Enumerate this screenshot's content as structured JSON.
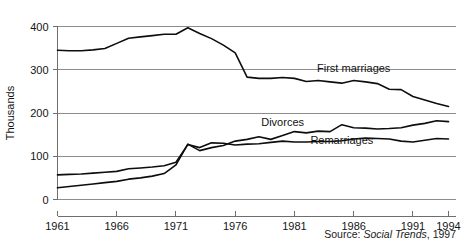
{
  "source_note": {
    "prefix": "Source:",
    "italic": "Social Trends",
    "suffix": ", 1997"
  },
  "chart_data": {
    "type": "line",
    "title": "",
    "xlabel": "",
    "ylabel": "Thousands",
    "xlim": [
      1961,
      1994
    ],
    "ylim": [
      0,
      400
    ],
    "yticks": [
      0,
      100,
      200,
      300,
      400
    ],
    "ytick_labels": [
      "0",
      "100",
      "200",
      "300",
      "400"
    ],
    "xticks": [
      1961,
      1966,
      1971,
      1976,
      1981,
      1986,
      1991,
      1994
    ],
    "xtick_labels": [
      "1961",
      "1966",
      "1971",
      "1976",
      "1981",
      "1986",
      "1991",
      "1994"
    ],
    "grid": "horizontal",
    "legend_position": "inline-labels",
    "x": [
      1961,
      1962,
      1963,
      1964,
      1965,
      1966,
      1967,
      1968,
      1969,
      1970,
      1971,
      1972,
      1973,
      1974,
      1975,
      1976,
      1977,
      1978,
      1979,
      1980,
      1981,
      1982,
      1983,
      1984,
      1985,
      1986,
      1987,
      1988,
      1989,
      1990,
      1991,
      1992,
      1993,
      1994
    ],
    "series": [
      {
        "name": "First marriages",
        "label": "First marriages",
        "label_x": 1986,
        "label_y": 295,
        "color": "#0d0d0d",
        "values": [
          345,
          344,
          344,
          346,
          349,
          361,
          373,
          376,
          379,
          382,
          382,
          397,
          384,
          372,
          357,
          339,
          283,
          280,
          280,
          282,
          280,
          273,
          275,
          272,
          269,
          275,
          272,
          268,
          255,
          254,
          238,
          230,
          222,
          215
        ]
      },
      {
        "name": "Divorces",
        "label": "Divorces",
        "label_x": 1980,
        "label_y": 170,
        "color": "#0d0d0d",
        "values": [
          27,
          30,
          33,
          36,
          39,
          42,
          47,
          50,
          54,
          60,
          80,
          128,
          113,
          120,
          125,
          135,
          139,
          145,
          139,
          148,
          157,
          154,
          158,
          157,
          173,
          166,
          165,
          163,
          164,
          166,
          172,
          176,
          182,
          180
        ]
      },
      {
        "name": "Remarriages",
        "label": "Remarriages",
        "label_x": 1985,
        "label_y": 128,
        "color": "#0d0d0d",
        "values": [
          57,
          58,
          59,
          61,
          63,
          65,
          71,
          73,
          75,
          78,
          86,
          127,
          120,
          131,
          130,
          126,
          128,
          129,
          132,
          135,
          133,
          133,
          134,
          134,
          136,
          140,
          142,
          141,
          140,
          135,
          133,
          137,
          141,
          140
        ]
      }
    ]
  }
}
